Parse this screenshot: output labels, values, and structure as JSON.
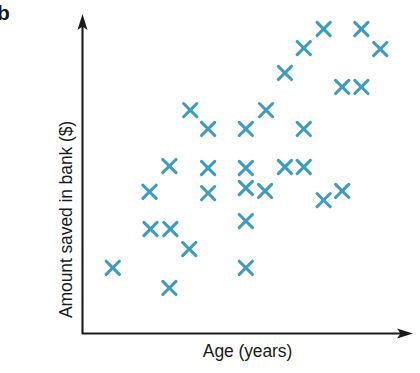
{
  "figure": {
    "panel_label": "b",
    "marker_color": "#3f9cbf",
    "axis_color": "#1b1b1b",
    "background": "#ffffff"
  },
  "chart_data": {
    "type": "scatter",
    "title": "",
    "xlabel": "Age (years)",
    "ylabel": "Amount saved in bank ($)",
    "grid": false,
    "legend": null,
    "axis_style": "arrow-headed, no tick marks, no tick labels",
    "xlim": [
      0,
      100
    ],
    "ylim": [
      0,
      100
    ],
    "marker": "x",
    "n_points": 30,
    "points": [
      {
        "x": 9.3,
        "y": 20.8
      },
      {
        "x": 20.4,
        "y": 44.7
      },
      {
        "x": 26.4,
        "y": 52.8
      },
      {
        "x": 26.7,
        "y": 33.0
      },
      {
        "x": 20.7,
        "y": 33.0
      },
      {
        "x": 32.4,
        "y": 26.7
      },
      {
        "x": 26.4,
        "y": 14.5
      },
      {
        "x": 38.1,
        "y": 64.5
      },
      {
        "x": 38.1,
        "y": 52.2
      },
      {
        "x": 38.1,
        "y": 44.3
      },
      {
        "x": 49.5,
        "y": 64.5
      },
      {
        "x": 49.5,
        "y": 52.2
      },
      {
        "x": 49.5,
        "y": 45.9
      },
      {
        "x": 49.5,
        "y": 35.5
      },
      {
        "x": 49.5,
        "y": 20.8
      },
      {
        "x": 55.6,
        "y": 70.4
      },
      {
        "x": 61.3,
        "y": 82.1
      },
      {
        "x": 55.3,
        "y": 45.0
      },
      {
        "x": 61.3,
        "y": 52.5
      },
      {
        "x": 67.0,
        "y": 52.5
      },
      {
        "x": 67.0,
        "y": 64.5
      },
      {
        "x": 67.0,
        "y": 89.9
      },
      {
        "x": 73.0,
        "y": 95.9
      },
      {
        "x": 73.0,
        "y": 42.1
      },
      {
        "x": 78.6,
        "y": 45.0
      },
      {
        "x": 78.6,
        "y": 77.7
      },
      {
        "x": 84.4,
        "y": 77.7
      },
      {
        "x": 84.4,
        "y": 95.9
      },
      {
        "x": 90.1,
        "y": 89.6
      },
      {
        "x": 32.7,
        "y": 70.4
      }
    ]
  }
}
